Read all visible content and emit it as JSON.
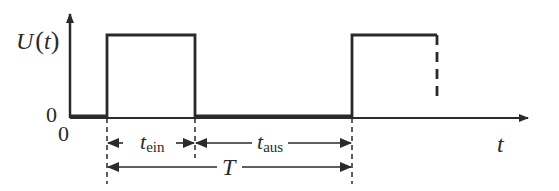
{
  "diagram": {
    "y_axis_label": "U",
    "y_axis_label_paren_open": "(",
    "y_axis_label_var": "t",
    "y_axis_label_paren_close": ")",
    "y_zero_label": "0",
    "x_origin_label": "0",
    "x_axis_label": "t",
    "on_time_label_main": "t",
    "on_time_label_sub": "ein",
    "off_time_label_main": "t",
    "off_time_label_sub": "aus",
    "period_label": "T",
    "line_color": "#2a2a2a"
  }
}
